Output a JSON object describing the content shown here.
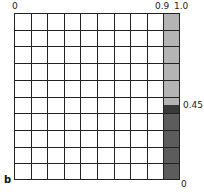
{
  "figure": {
    "panel_label": "b",
    "top_axis": {
      "left": "0",
      "tick_09": "0.9",
      "tick_10": "1.0"
    },
    "right_axis": {
      "mid": "0.45",
      "bottom": "0"
    },
    "grid": {
      "rows": 10,
      "cols": 10
    },
    "shaded_column": {
      "x_range": [
        0.9,
        1.0
      ],
      "upper_fill": "#b4b4b4",
      "boundary_fill": "#3a3a3a",
      "lower_fill": "#5c5c5c",
      "threshold": 0.45
    }
  }
}
